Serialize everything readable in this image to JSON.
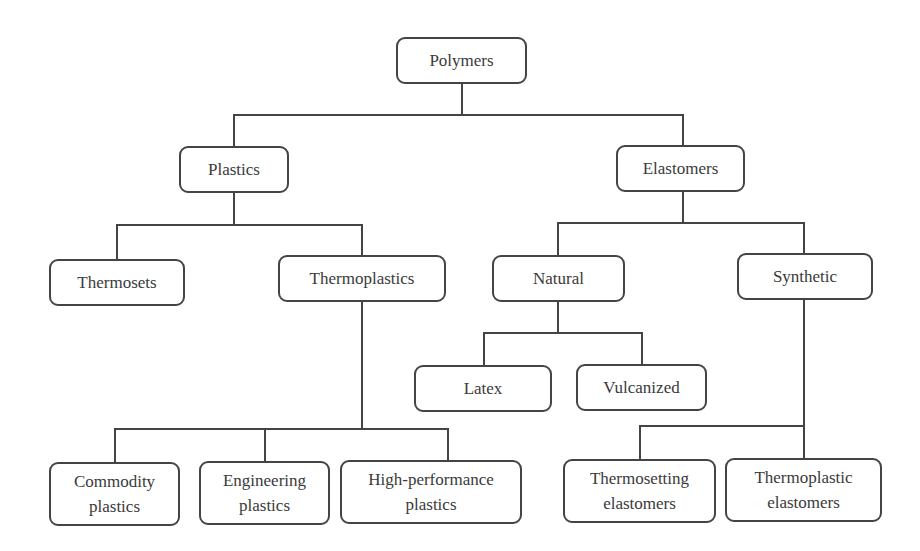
{
  "diagram": {
    "type": "tree",
    "colors": {
      "stroke": "#444444",
      "text": "#3a3a3a",
      "background": "#ffffff"
    },
    "root": {
      "label": "Polymers",
      "children": [
        {
          "label": "Plastics",
          "children": [
            {
              "label": "Thermosets"
            },
            {
              "label": "Thermoplastics",
              "children": [
                {
                  "label_line1": "Commodity",
                  "label_line2": "plastics"
                },
                {
                  "label_line1": "Engineering",
                  "label_line2": "plastics"
                },
                {
                  "label_line1": "High-performance",
                  "label_line2": "plastics"
                }
              ]
            }
          ]
        },
        {
          "label": "Elastomers",
          "children": [
            {
              "label": "Natural",
              "children": [
                {
                  "label": "Latex"
                },
                {
                  "label": "Vulcanized"
                }
              ]
            },
            {
              "label": "Synthetic",
              "children": [
                {
                  "label_line1": "Thermosetting",
                  "label_line2": "elastomers"
                },
                {
                  "label_line1": "Thermoplastic",
                  "label_line2": "elastomers"
                }
              ]
            }
          ]
        }
      ]
    }
  }
}
